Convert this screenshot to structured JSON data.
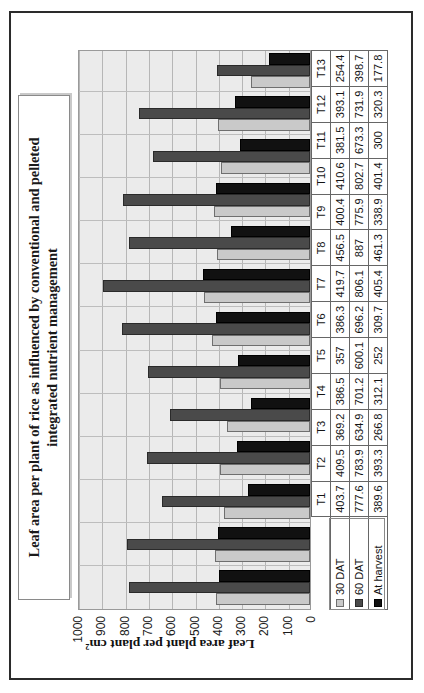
{
  "chart_data": {
    "type": "bar",
    "orientation": "vertical-rendered-rotated",
    "title": "Leaf area per plant of rice as influenced by conventional and pelleted integrated nutrient management",
    "xlabel": "",
    "ylabel": "Leaf area plant per plant cm²",
    "ylim": [
      0,
      1000
    ],
    "yticks": [
      0,
      100,
      200,
      300,
      400,
      500,
      600,
      700,
      800,
      900,
      1000
    ],
    "ytick_labels": [
      "0",
      "100",
      "200",
      "300",
      "400",
      "500",
      "600",
      "700",
      "800",
      "900",
      "1000"
    ],
    "grid": true,
    "legend_position": "data-table-row-headers",
    "categories": [
      "T1",
      "T2",
      "T3",
      "T4",
      "T5",
      "T6",
      "T7",
      "T8",
      "T9",
      "T10",
      "T11",
      "T12",
      "T13"
    ],
    "series": [
      {
        "name": "30 DAT",
        "color": "#c9c9c9",
        "values": [
          403.7,
          409.5,
          369.2,
          386.5,
          357,
          386.3,
          419.7,
          456.5,
          400.4,
          410.6,
          381.5,
          393.1,
          254.4
        ],
        "labels": [
          "403.7",
          "409.5",
          "369.2",
          "386.5",
          "357",
          "386.3",
          "419.7",
          "456.5",
          "400.4",
          "410.6",
          "381.5",
          "393.1",
          "254.4"
        ]
      },
      {
        "name": "60 DAT",
        "color": "#4a4a4a",
        "values": [
          777.6,
          783.9,
          634.9,
          701.2,
          600.1,
          696.2,
          806.1,
          887,
          775.9,
          802.7,
          673.3,
          731.9,
          398.7
        ],
        "labels": [
          "777.6",
          "783.9",
          "634.9",
          "701.2",
          "600.1",
          "696.2",
          "806.1",
          "887",
          "775.9",
          "802.7",
          "673.3",
          "731.9",
          "398.7"
        ]
      },
      {
        "name": "At harvest",
        "color": "#111111",
        "values": [
          389.6,
          393.3,
          266.8,
          312.1,
          252,
          309.7,
          405.4,
          461.3,
          338.9,
          401.4,
          300,
          320.3,
          177.8
        ],
        "labels": [
          "389.6",
          "393.3",
          "266.8",
          "312.1",
          "252",
          "309.7",
          "405.4",
          "461.3",
          "338.9",
          "401.4",
          "300",
          "320.3",
          "177.8"
        ]
      }
    ]
  },
  "table": {
    "column_headers": [
      "T1",
      "T2",
      "T3",
      "T4",
      "T5",
      "T6",
      "T7",
      "T8",
      "T9",
      "T10",
      "T11",
      "T12",
      "T13"
    ],
    "rows": [
      {
        "label": "30 DAT",
        "cells": [
          "403.7",
          "409.5",
          "369.2",
          "386.5",
          "357",
          "386.3",
          "419.7",
          "456.5",
          "400.4",
          "410.6",
          "381.5",
          "393.1",
          "254.4"
        ]
      },
      {
        "label": "60 DAT",
        "cells": [
          "777.6",
          "783.9",
          "634.9",
          "701.2",
          "600.1",
          "696.2",
          "806.1",
          "887",
          "775.9",
          "802.7",
          "673.3",
          "731.9",
          "398.7"
        ]
      },
      {
        "label": "At harvest",
        "cells": [
          "389.6",
          "393.3",
          "266.8",
          "312.1",
          "252",
          "309.7",
          "405.4",
          "461.3",
          "338.9",
          "401.4",
          "300",
          "320.3",
          "177.8"
        ]
      }
    ]
  }
}
